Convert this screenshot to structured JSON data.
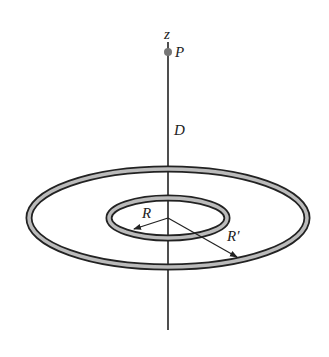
{
  "diagram": {
    "labels": {
      "axis": "z",
      "point": "P",
      "distance": "D",
      "inner_radius": "R",
      "outer_radius": "R′"
    },
    "colors": {
      "line": "#222222",
      "ring_fill": "#bbbbbb",
      "point": "#777777",
      "background": "#ffffff"
    }
  }
}
